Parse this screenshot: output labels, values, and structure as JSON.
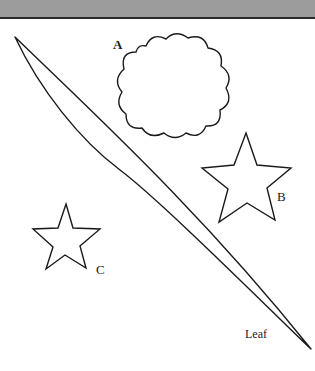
{
  "figure": {
    "header_band_color": "#9c9c9c",
    "stroke_color": "#1a1a1a",
    "shapes": [
      {
        "id": "A",
        "kind": "cloud",
        "label": "A"
      },
      {
        "id": "B",
        "kind": "star",
        "label": "B"
      },
      {
        "id": "C",
        "kind": "star",
        "label": "C"
      },
      {
        "id": "leaf",
        "kind": "leaf",
        "label": "Leaf"
      }
    ]
  },
  "labels": {
    "cloud": "A",
    "star_large": "B",
    "star_small": "C",
    "leaf": "Leaf"
  }
}
